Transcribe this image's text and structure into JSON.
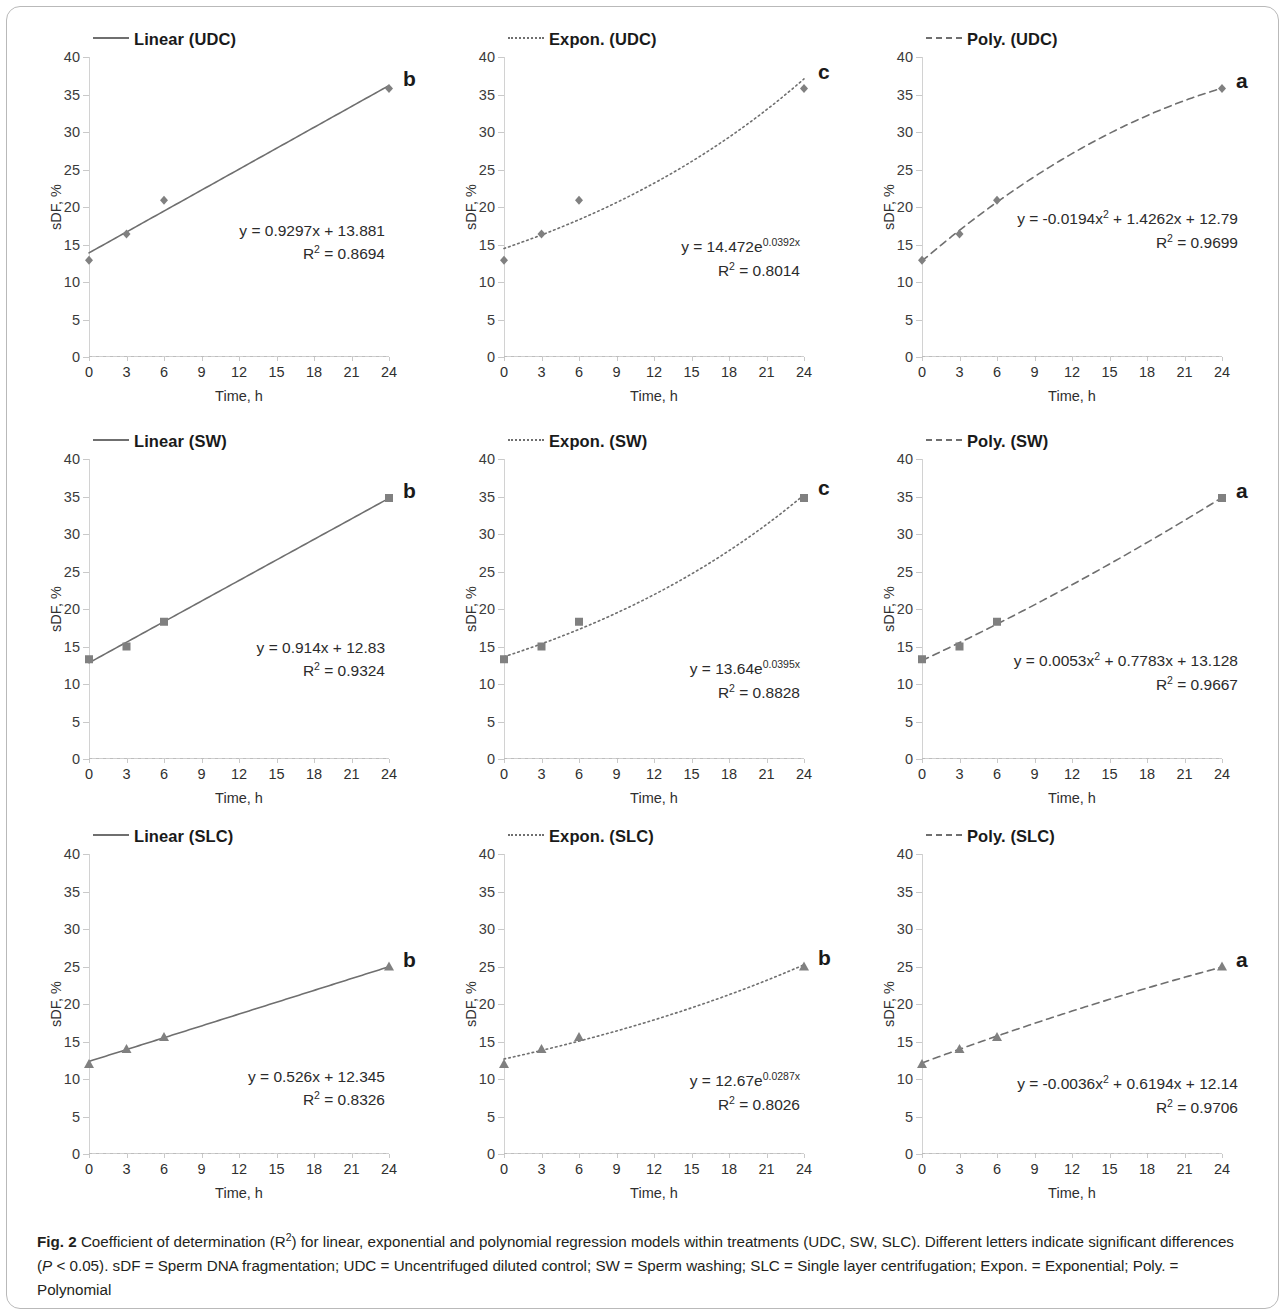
{
  "figure": {
    "label": "Fig. 2",
    "caption_part1": " Coefficient of determination (R",
    "caption_sup1": "2",
    "caption_part2": ") for linear, exponential and polynomial regression models within treatments (UDC, SW, SLC). Different letters indicate significant differences (",
    "caption_italic_p": "P",
    "caption_part3": " < 0.05). sDF = Sperm DNA fragmentation; UDC = Uncentrifuged diluted control; SW = Sperm washing; SLC = Single layer centrifugation; Expon. = Exponential; Poly. = Polynomial"
  },
  "axes": {
    "x_title": "Time, h",
    "y_title": "sDF, %",
    "x_ticks": [
      "0",
      "3",
      "6",
      "9",
      "12",
      "15",
      "18",
      "21",
      "24"
    ],
    "y_ticks": [
      "40",
      "35",
      "30",
      "25",
      "20",
      "15",
      "10",
      "5",
      "0"
    ],
    "ylim": [
      0,
      40
    ],
    "x_categories": [
      0,
      3,
      6,
      9,
      12,
      15,
      18,
      21,
      24
    ]
  },
  "colors": {
    "line": "#6f6f6f",
    "marker": "#808080",
    "axis": "#c9c9c9",
    "text": "#231f20",
    "frame": "#b9b9b9"
  },
  "chart_data": [
    {
      "id": "linear-udc",
      "type": "scatter",
      "title": "Linear  (UDC)",
      "legend_label": "Linear  (UDC)",
      "line_style": "solid",
      "marker": "diamond",
      "model": "linear",
      "xlabel": "Time, h",
      "ylabel": "sDF, %",
      "ylim": [
        0,
        40
      ],
      "x": [
        0,
        3,
        6,
        24
      ],
      "y": [
        12.9,
        16.4,
        20.9,
        35.8
      ],
      "fit": {
        "slope": 0.9297,
        "intercept": 13.881
      },
      "equation_line1": "y = 0.9297x + 13.881",
      "equation_line2": "R² = 0.8694",
      "r2": 0.8694,
      "sig_letter": "b"
    },
    {
      "id": "expon-udc",
      "type": "scatter",
      "title": "Expon.  (UDC)",
      "legend_label": "Expon.  (UDC)",
      "line_style": "dotted",
      "marker": "diamond",
      "model": "exponential",
      "xlabel": "Time, h",
      "ylabel": "sDF, %",
      "ylim": [
        0,
        40
      ],
      "x": [
        0,
        3,
        6,
        24
      ],
      "y": [
        12.9,
        16.4,
        20.9,
        35.8
      ],
      "fit": {
        "a": 14.472,
        "b": 0.0392
      },
      "equation_prefix": "y = 14.472e",
      "equation_exp": "0.0392x",
      "equation_line2": "R² = 0.8014",
      "r2": 0.8014,
      "sig_letter": "c"
    },
    {
      "id": "poly-udc",
      "type": "scatter",
      "title": "Poly.  (UDC)",
      "legend_label": "Poly.  (UDC)",
      "line_style": "dashed",
      "marker": "diamond",
      "model": "polynomial",
      "xlabel": "Time, h",
      "ylabel": "sDF, %",
      "ylim": [
        0,
        40
      ],
      "x": [
        0,
        3,
        6,
        24
      ],
      "y": [
        12.9,
        16.4,
        20.9,
        35.8
      ],
      "fit": {
        "a": -0.0194,
        "b": 1.4262,
        "c": 12.79
      },
      "equation_prefix": "y = -0.0194x",
      "equation_exp": "2",
      "equation_suffix": " + 1.4262x + 12.79",
      "equation_line2": "R² = 0.9699",
      "r2": 0.9699,
      "sig_letter": "a"
    },
    {
      "id": "linear-sw",
      "type": "scatter",
      "title": "Linear  (SW)",
      "legend_label": "Linear  (SW)",
      "line_style": "solid",
      "marker": "square",
      "model": "linear",
      "xlabel": "Time, h",
      "ylabel": "sDF, %",
      "ylim": [
        0,
        40
      ],
      "x": [
        0,
        3,
        6,
        24
      ],
      "y": [
        13.3,
        15.0,
        18.3,
        34.8
      ],
      "fit": {
        "slope": 0.914,
        "intercept": 12.83
      },
      "equation_line1": "y = 0.914x + 12.83",
      "equation_line2": "R² = 0.9324",
      "r2": 0.9324,
      "sig_letter": "b"
    },
    {
      "id": "expon-sw",
      "type": "scatter",
      "title": "Expon.  (SW)",
      "legend_label": "Expon.  (SW)",
      "line_style": "dotted",
      "marker": "square",
      "model": "exponential",
      "xlabel": "Time, h",
      "ylabel": "sDF, %",
      "ylim": [
        0,
        40
      ],
      "x": [
        0,
        3,
        6,
        24
      ],
      "y": [
        13.3,
        15.0,
        18.3,
        34.8
      ],
      "fit": {
        "a": 13.64,
        "b": 0.0395
      },
      "equation_prefix": "y = 13.64e",
      "equation_exp": "0.0395x",
      "equation_line2": "R² = 0.8828",
      "r2": 0.8828,
      "sig_letter": "c"
    },
    {
      "id": "poly-sw",
      "type": "scatter",
      "title": "Poly.  (SW)",
      "legend_label": "Poly.  (SW)",
      "line_style": "dashed",
      "marker": "square",
      "model": "polynomial",
      "xlabel": "Time, h",
      "ylabel": "sDF, %",
      "ylim": [
        0,
        40
      ],
      "x": [
        0,
        3,
        6,
        24
      ],
      "y": [
        13.3,
        15.0,
        18.3,
        34.8
      ],
      "fit": {
        "a": 0.0053,
        "b": 0.7783,
        "c": 13.128
      },
      "equation_prefix": "y = 0.0053x",
      "equation_exp": "2",
      "equation_suffix": " + 0.7783x + 13.128",
      "equation_line2": "R² = 0.9667",
      "r2": 0.9667,
      "sig_letter": "a"
    },
    {
      "id": "linear-slc",
      "type": "scatter",
      "title": "Linear  (SLC)",
      "legend_label": "Linear  (SLC)",
      "line_style": "solid",
      "marker": "triangle",
      "model": "linear",
      "xlabel": "Time, h",
      "ylabel": "sDF, %",
      "ylim": [
        0,
        40
      ],
      "x": [
        0,
        3,
        6,
        24
      ],
      "y": [
        12.0,
        14.0,
        15.6,
        25.0
      ],
      "fit": {
        "slope": 0.526,
        "intercept": 12.345
      },
      "equation_line1": "y = 0.526x + 12.345",
      "equation_line2": "R² = 0.8326",
      "r2": 0.8326,
      "sig_letter": "b"
    },
    {
      "id": "expon-slc",
      "type": "scatter",
      "title": "Expon.  (SLC)",
      "legend_label": "Expon.  (SLC)",
      "line_style": "dotted",
      "marker": "triangle",
      "model": "exponential",
      "xlabel": "Time, h",
      "ylabel": "sDF, %",
      "ylim": [
        0,
        40
      ],
      "x": [
        0,
        3,
        6,
        24
      ],
      "y": [
        12.0,
        14.0,
        15.6,
        25.0
      ],
      "fit": {
        "a": 12.67,
        "b": 0.0287
      },
      "equation_prefix": "y = 12.67e",
      "equation_exp": "0.0287x",
      "equation_line2": "R² = 0.8026",
      "r2": 0.8026,
      "sig_letter": "b"
    },
    {
      "id": "poly-slc",
      "type": "scatter",
      "title": "Poly.  (SLC)",
      "legend_label": "Poly.  (SLC)",
      "line_style": "dashed",
      "marker": "triangle",
      "model": "polynomial",
      "xlabel": "Time, h",
      "ylabel": "sDF, %",
      "ylim": [
        0,
        40
      ],
      "x": [
        0,
        3,
        6,
        24
      ],
      "y": [
        12.0,
        14.0,
        15.6,
        25.0
      ],
      "fit": {
        "a": -0.0036,
        "b": 0.6194,
        "c": 12.14
      },
      "equation_prefix": "y = -0.0036x",
      "equation_exp": "2",
      "equation_suffix": " + 0.6194x + 12.14",
      "equation_line2": "R² = 0.9706",
      "r2": 0.9706,
      "sig_letter": "a"
    }
  ]
}
